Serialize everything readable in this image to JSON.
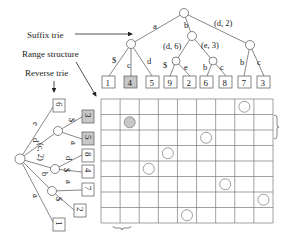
{
  "labels": {
    "suffix_trie": "Suffix trie",
    "range_structure": "Range structure",
    "reverse_trie": "Reverse trie"
  },
  "suffix_trie": {
    "edges": {
      "root_a": "a",
      "root_b": "b",
      "root_d2": "(d, 2)",
      "a_dollar": "$",
      "a_c": "c",
      "a_d": "d",
      "b_d6": "(d, 6)",
      "b_e3": "(e, 3)",
      "d6_dollar": "$",
      "d6_e": "e",
      "e3_b": "b",
      "e3_c": "c",
      "d2_b": "b",
      "d2_c": "c"
    },
    "leaves": [
      "1",
      "4",
      "5",
      "9",
      "2",
      "6",
      "8",
      "7",
      "3"
    ],
    "highlighted_leaf": "4"
  },
  "reverse_trie": {
    "edges": {
      "root_e": "e",
      "root_d": "d",
      "root_c2": "(c, 2)",
      "root_b": "b",
      "root_a": "a",
      "d_dollar": "$",
      "d_a": "a",
      "c2_d": "d",
      "c2_dollar": "$",
      "b_a": "a",
      "b_dollar": "$"
    },
    "leaves": [
      "6",
      "3",
      "5",
      "8",
      "4",
      "7",
      "2",
      "1"
    ],
    "highlighted_leaves": [
      "3",
      "5"
    ]
  },
  "grid": {
    "cols": 9,
    "rows": 8,
    "points": [
      {
        "row": 0,
        "col": 7,
        "filled": false
      },
      {
        "row": 1,
        "col": 1,
        "filled": true
      },
      {
        "row": 2,
        "col": 5,
        "filled": false
      },
      {
        "row": 3,
        "col": 3,
        "filled": false
      },
      {
        "row": 4,
        "col": 2,
        "filled": false
      },
      {
        "row": 5,
        "col": 6,
        "filled": false
      },
      {
        "row": 6,
        "col": 8,
        "filled": false
      },
      {
        "row": 7,
        "col": 4,
        "filled": false
      }
    ]
  },
  "colors": {
    "line": "#555555",
    "grid": "#7a7a7a",
    "highlight_fill": "#c8c8c8",
    "text": "#222222"
  }
}
